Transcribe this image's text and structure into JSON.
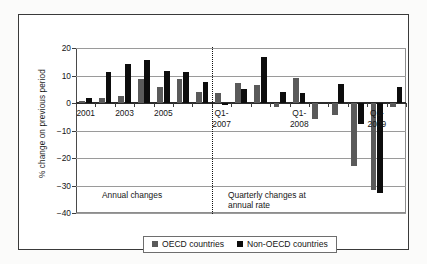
{
  "chart_data": {
    "type": "bar",
    "title": "",
    "xlabel": "",
    "ylabel": "% change on previous period",
    "ylim": [
      -40,
      20
    ],
    "yticks": [
      20,
      10,
      0,
      -10,
      -20,
      -30,
      -40
    ],
    "grid": true,
    "legend_position": "bottom",
    "categories": [
      "2001",
      "2002",
      "2003",
      "2004",
      "2005",
      "2006",
      "2007",
      "Q1-2007",
      "Q2-2007",
      "Q3-2007",
      "Q4-2007",
      "Q1-2008",
      "Q2-2008",
      "Q3-2008",
      "Q4-2008",
      "Q1-2009",
      "Q2-2009"
    ],
    "series": [
      {
        "name": "OECD countries",
        "color": "#5a5a5a",
        "values": [
          0.6,
          2.0,
          2.6,
          8.7,
          6.0,
          8.7,
          4.1,
          3.8,
          7.4,
          6.7,
          -1.4,
          9.0,
          -5.8,
          -4.5,
          -23.0,
          -31.5,
          -1.6
        ]
      },
      {
        "name": "Non-OECD countries",
        "color": "#0d0d0d",
        "values": [
          1.8,
          11.1,
          14.3,
          15.7,
          11.5,
          11.2,
          7.7,
          -0.8,
          5.2,
          16.6,
          4.0,
          3.8,
          0.0,
          7.0,
          -7.6,
          -32.7,
          5.7
        ]
      }
    ],
    "xtick_labels": [
      {
        "category_index": 0,
        "text": "2001"
      },
      {
        "category_index": 2,
        "text": "2003"
      },
      {
        "category_index": 4,
        "text": "2005"
      },
      {
        "category_index": 7,
        "text": "Q1-\n2007"
      },
      {
        "category_index": 11,
        "text": "Q1-\n2008"
      },
      {
        "category_index": 15,
        "text": "Q1-\n2009"
      }
    ],
    "annotations": [
      {
        "name": "annual-changes-note",
        "text": "Annual changes"
      },
      {
        "name": "quarterly-changes-note",
        "text": "Quarterly changes at\nannual rate"
      }
    ],
    "divider": {
      "after_category_index": 6,
      "style": "dotted"
    }
  },
  "legend": {
    "items": [
      {
        "label": "OECD countries",
        "color": "#5a5a5a"
      },
      {
        "label": "Non-OECD countries",
        "color": "#0d0d0d"
      }
    ]
  }
}
